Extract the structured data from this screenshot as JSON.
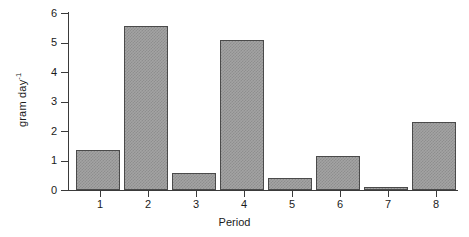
{
  "chart_data": {
    "type": "bar",
    "title": "",
    "subtitle": "",
    "xlabel": "Period",
    "ylabel": "gram day",
    "ylabel_superscript": "-1",
    "ylabel_full": "gram day⁻¹",
    "categories": [
      "1",
      "2",
      "3",
      "4",
      "5",
      "6",
      "7",
      "8"
    ],
    "values": [
      1.35,
      5.55,
      0.58,
      5.08,
      0.42,
      1.17,
      0.1,
      2.3
    ],
    "ylim": [
      0,
      6
    ],
    "ytick_labels": [
      "0",
      "1",
      "2",
      "3",
      "4",
      "5",
      "6"
    ],
    "ytick_values": [
      0,
      1,
      2,
      3,
      4,
      5,
      6
    ],
    "xtick_labels": [
      "1",
      "2",
      "3",
      "4",
      "5",
      "6",
      "7",
      "8"
    ],
    "grid": false,
    "legend": false,
    "legend_position": "none",
    "bar_fill_color": "#a3a3a3",
    "bar_pattern": "checkerboard-dither",
    "bar_border_color": "#4a4a4a",
    "axis_color": "#3a3a3a",
    "background_color": "#ffffff",
    "series": [
      {
        "name": "gram day-1",
        "values": [
          1.35,
          5.55,
          0.58,
          5.08,
          0.42,
          1.17,
          0.1,
          2.3
        ]
      }
    ]
  }
}
